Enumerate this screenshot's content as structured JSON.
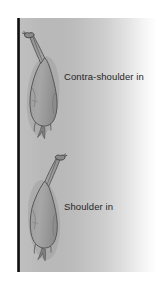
{
  "figure": {
    "background_color": "#ffffff",
    "panel": {
      "name": "arena-surface",
      "fill_start_color": "#b4b4b4",
      "fill_end_color": "#ffffff"
    },
    "wall": {
      "name": "arena-wall",
      "color": "#0a0a0a",
      "orientation": "vertical"
    }
  },
  "labels": [
    {
      "id": "contra",
      "text": "Contra-shoulder in"
    },
    {
      "id": "shoulder",
      "text": "Shoulder in"
    }
  ],
  "horses": [
    {
      "id": "contra",
      "name": "horse-contra-shoulder-in",
      "view": "from above",
      "body_color": "#9a9a9a",
      "outline_color": "#4a4a4a",
      "head_position": "top-left, against the wall",
      "haunch_position": "bottom, off the wall"
    },
    {
      "id": "shoulder",
      "name": "horse-shoulder-in",
      "view": "from above",
      "body_color": "#9a9a9a",
      "outline_color": "#4a4a4a",
      "head_position": "top-right, away from the wall",
      "haunch_position": "bottom, on the wall"
    }
  ]
}
